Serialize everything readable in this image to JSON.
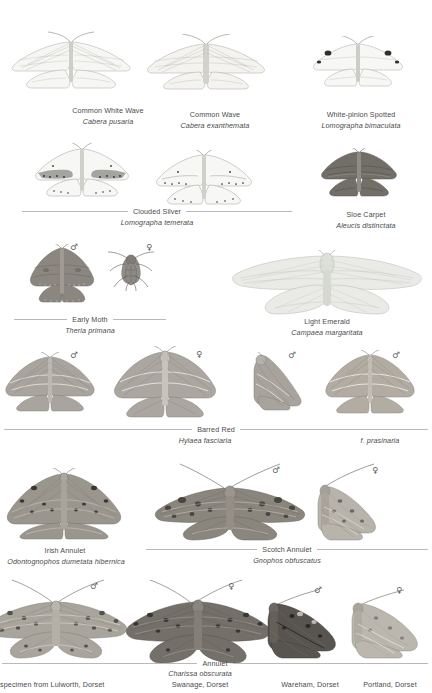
{
  "page": {
    "background": "#ffffff",
    "text_color": "#4b4b4b",
    "rule_color": "#b9b9b9",
    "symbols": {
      "male": "♂",
      "female": "♀"
    }
  },
  "species": [
    {
      "id": "common-white-wave",
      "common_name": "Common White Wave",
      "scientific_name": "Cabera pusaria",
      "wing_color": "#f2f2f0"
    },
    {
      "id": "common-wave",
      "common_name": "Common Wave",
      "scientific_name": "Cabera exanthemata",
      "wing_color": "#f0efec"
    },
    {
      "id": "white-pinion-spotted",
      "common_name": "White-pinion Spotted",
      "scientific_name": "Lomographa bimaculata",
      "wing_color": "#f4f4f2"
    },
    {
      "id": "clouded-silver",
      "common_name": "Clouded Silver",
      "scientific_name": "Lomographa temerata",
      "wing_color": "#f3f3f1"
    },
    {
      "id": "sloe-carpet",
      "common_name": "Sloe Carpet",
      "scientific_name": "Aleucis distinctata",
      "wing_color": "#76726c"
    },
    {
      "id": "early-moth",
      "common_name": "Early Moth",
      "scientific_name": "Theria primana",
      "wing_color": "#8e8a84"
    },
    {
      "id": "light-emerald",
      "common_name": "Light Emerald",
      "scientific_name": "Campaea margaritata",
      "wing_color": "#e9eae6"
    },
    {
      "id": "barred-red",
      "common_name": "Barred Red",
      "scientific_name": "Hylaea fasciaria",
      "form_label": "f. prasinaria",
      "wing_color": "#a9a49d"
    },
    {
      "id": "irish-annulet",
      "common_name": "Irish Annulet",
      "scientific_name": "Odontognophos dumetata hibernica",
      "wing_color": "#9b968e"
    },
    {
      "id": "scotch-annulet",
      "common_name": "Scotch Annulet",
      "scientific_name": "Gnophos obfuscatus",
      "wing_color": "#8b867f"
    },
    {
      "id": "annulet",
      "common_name": "Annulet",
      "scientific_name": "Charissa obscurata",
      "wing_color": "#908b84"
    }
  ],
  "locality_labels": [
    "specimen from Lulworth, Dorset",
    "Swanage, Dorset",
    "Wareham, Dorset",
    "Portland, Dorset"
  ],
  "sex_marks": [
    {
      "for": "early-moth",
      "sex": "♂"
    },
    {
      "for": "early-moth",
      "sex": "♀"
    },
    {
      "for": "barred-red",
      "sex": "♂"
    },
    {
      "for": "barred-red",
      "sex": "♀"
    },
    {
      "for": "barred-red",
      "sex": "♂"
    },
    {
      "for": "barred-red-form",
      "sex": "♂"
    },
    {
      "for": "scotch-annulet",
      "sex": "♂"
    },
    {
      "for": "scotch-annulet",
      "sex": "♀"
    },
    {
      "for": "annulet",
      "sex": "♂"
    },
    {
      "for": "annulet",
      "sex": "♀"
    },
    {
      "for": "annulet",
      "sex": "♂"
    },
    {
      "for": "annulet",
      "sex": "♀"
    }
  ]
}
